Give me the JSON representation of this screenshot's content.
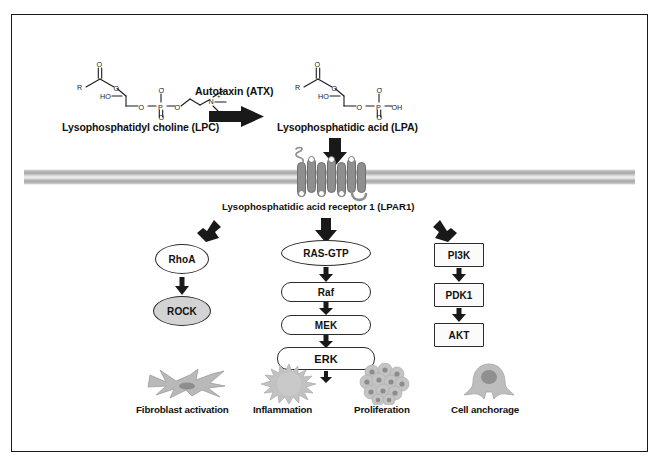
{
  "figure": {
    "border_color": "#1a1a1a",
    "background": "#ffffff"
  },
  "substrate": {
    "label": "Lysophosphatidyl choline (LPC)",
    "atoms": {
      "r": "R",
      "o": "O",
      "ho": "HO",
      "n": "N",
      "o_minus": "O",
      "p": "P"
    }
  },
  "enzyme": {
    "label": "Autotaxin (ATX)",
    "arrow": "thick-right-arrow"
  },
  "product": {
    "label": "Lysophosphatidic acid (LPA)",
    "atoms": {
      "r": "R",
      "o": "O",
      "ho": "HO",
      "oh": "OH",
      "p": "P"
    }
  },
  "receptor": {
    "label": "Lysophosphatidic acid receptor 1 (LPAR1)",
    "helix_count": 7,
    "helix_color": "#8f8f8f",
    "membrane_color": "#a8a8a8"
  },
  "arrows": {
    "ligand_to_receptor": "thick-down-arrow",
    "receptor_to_left": "thick-down-left-arrow",
    "receptor_to_center": "thick-down-arrow",
    "receptor_to_right": "thick-down-right-arrow",
    "outcome": "thin-down-arrow"
  },
  "pathways": {
    "left": {
      "name": "RhoA/ROCK cascade",
      "nodes": [
        {
          "label": "RhoA",
          "shape": "ellipse",
          "fill": "#ffffff"
        },
        {
          "label": "ROCK",
          "shape": "ellipse",
          "fill": "#d3d3d3"
        }
      ]
    },
    "center": {
      "name": "MAPK cascade",
      "nodes": [
        {
          "label": "RAS-GTP",
          "shape": "ellipse",
          "fill": "#ffffff"
        },
        {
          "label": "Raf",
          "shape": "pill",
          "fill": "#ffffff"
        },
        {
          "label": "MEK",
          "shape": "pill",
          "fill": "#ffffff"
        },
        {
          "label": "ERK",
          "shape": "pill",
          "fill": "#ffffff"
        }
      ]
    },
    "right": {
      "name": "PI3K/AKT cascade",
      "nodes": [
        {
          "label": "PI3K",
          "shape": "rect",
          "fill": "#fbfbfb"
        },
        {
          "label": "PDK1",
          "shape": "rect",
          "fill": "#fbfbfb"
        },
        {
          "label": "AKT",
          "shape": "rect",
          "fill": "#fbfbfb"
        }
      ]
    }
  },
  "outcomes": [
    {
      "label": "Fibroblast activation",
      "icon": "fibroblast-cell-icon"
    },
    {
      "label": "Inflammation",
      "icon": "spiky-immune-cell-icon"
    },
    {
      "label": "Proliferation",
      "icon": "cell-cluster-icon"
    },
    {
      "label": "Cell anchorage",
      "icon": "adherent-cell-icon"
    }
  ]
}
